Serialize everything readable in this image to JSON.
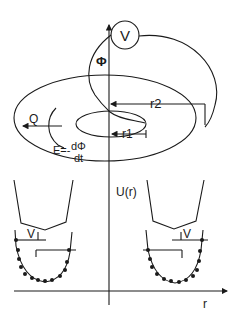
{
  "diagram": {
    "labels": {
      "voltmeter": "V",
      "flux": "Φ",
      "outer_radius": "r2",
      "inner_radius": "r1",
      "charge": "Q",
      "emf_lhs": "E=-",
      "emf_num": "dΦ",
      "emf_den": "dt",
      "potential_axis": "U(r)",
      "radius_axis": "r",
      "left_well_V": "V",
      "right_well_V": "V"
    },
    "colors": {
      "line": "#1a1a1a",
      "background": "#ffffff"
    }
  }
}
